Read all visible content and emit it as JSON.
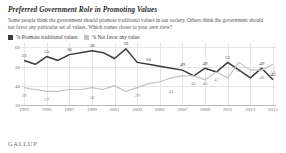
{
  "header": {
    "title": "Preferred Government Role in Promoting Values",
    "subtitle": "Some people think the government should promote traditional values in our society. Others think the government should not favor any particular set of values. Which comes closer to your own view?"
  },
  "legend": [
    {
      "label": "% Promote traditional values",
      "color": "#3c3c3c"
    },
    {
      "label": "% Not favor any value",
      "color": "#c3c3c1"
    }
  ],
  "footer": {
    "brand": "GALLUP"
  },
  "chart_data": {
    "type": "line",
    "title": "Preferred Government Role in Promoting Values",
    "xlabel": "",
    "ylabel": "",
    "ylim": [
      30,
      62
    ],
    "yticks": [
      30,
      40,
      50,
      60
    ],
    "grid": true,
    "legend_position": "top-left",
    "x": [
      1993,
      1994,
      1995,
      1996,
      1997,
      1998,
      1999,
      2000,
      2001,
      2002,
      2003,
      2004,
      2005,
      2006,
      2007,
      2008,
      2009,
      2010,
      2011,
      2012,
      2013,
      2014,
      2015
    ],
    "xtick_labels": [
      "1993",
      "1995",
      "1997",
      "1999",
      "2001",
      "2003",
      "2005",
      "2007",
      "2009",
      "2011",
      "2013",
      "2015"
    ],
    "series": [
      {
        "name": "% Promote traditional values",
        "color": "#3c3c3c",
        "values": [
          53,
          51,
          55,
          53,
          56,
          57,
          58,
          57,
          54,
          59,
          52,
          51,
          50,
          49,
          48,
          45,
          49,
          47,
          52,
          48,
          44,
          49,
          43
        ],
        "labels": [
          {
            "x": 1993,
            "y": 53,
            "text": "53"
          },
          {
            "x": 1995,
            "y": 55,
            "text": "55"
          },
          {
            "x": 1997,
            "y": 56,
            "text": "56"
          },
          {
            "x": 1999,
            "y": 58,
            "text": "58"
          },
          {
            "x": 2002,
            "y": 59,
            "text": "59"
          },
          {
            "x": 2004,
            "y": 51,
            "text": "50"
          },
          {
            "x": 2007,
            "y": 48,
            "text": "49"
          },
          {
            "x": 2009,
            "y": 49,
            "text": "49"
          },
          {
            "x": 2011,
            "y": 52,
            "text": "52"
          },
          {
            "x": 2014,
            "y": 49,
            "text": "49"
          },
          {
            "x": 2015,
            "y": 43,
            "text": "43"
          }
        ]
      },
      {
        "name": "% Not favor any value",
        "color": "#c3c3c1",
        "values": [
          39,
          38,
          37,
          37,
          38,
          38,
          39,
          38,
          40,
          37,
          39,
          41,
          42,
          44,
          45,
          45,
          43,
          47,
          44,
          52,
          48,
          48,
          51
        ],
        "labels": [
          {
            "x": 1993,
            "y": 39,
            "text": "39"
          },
          {
            "x": 1995,
            "y": 37,
            "text": "37"
          },
          {
            "x": 1999,
            "y": 38,
            "text": "38"
          },
          {
            "x": 2003,
            "y": 39,
            "text": "39"
          },
          {
            "x": 2006,
            "y": 41,
            "text": "41"
          },
          {
            "x": 2008,
            "y": 45,
            "text": "45"
          },
          {
            "x": 2009,
            "y": 45,
            "text": "45"
          },
          {
            "x": 2010,
            "y": 47,
            "text": "47"
          },
          {
            "x": 2012,
            "y": 52,
            "text": "52"
          },
          {
            "x": 2014,
            "y": 48,
            "text": "48"
          },
          {
            "x": 2015,
            "y": 51,
            "text": "51"
          }
        ]
      }
    ]
  }
}
